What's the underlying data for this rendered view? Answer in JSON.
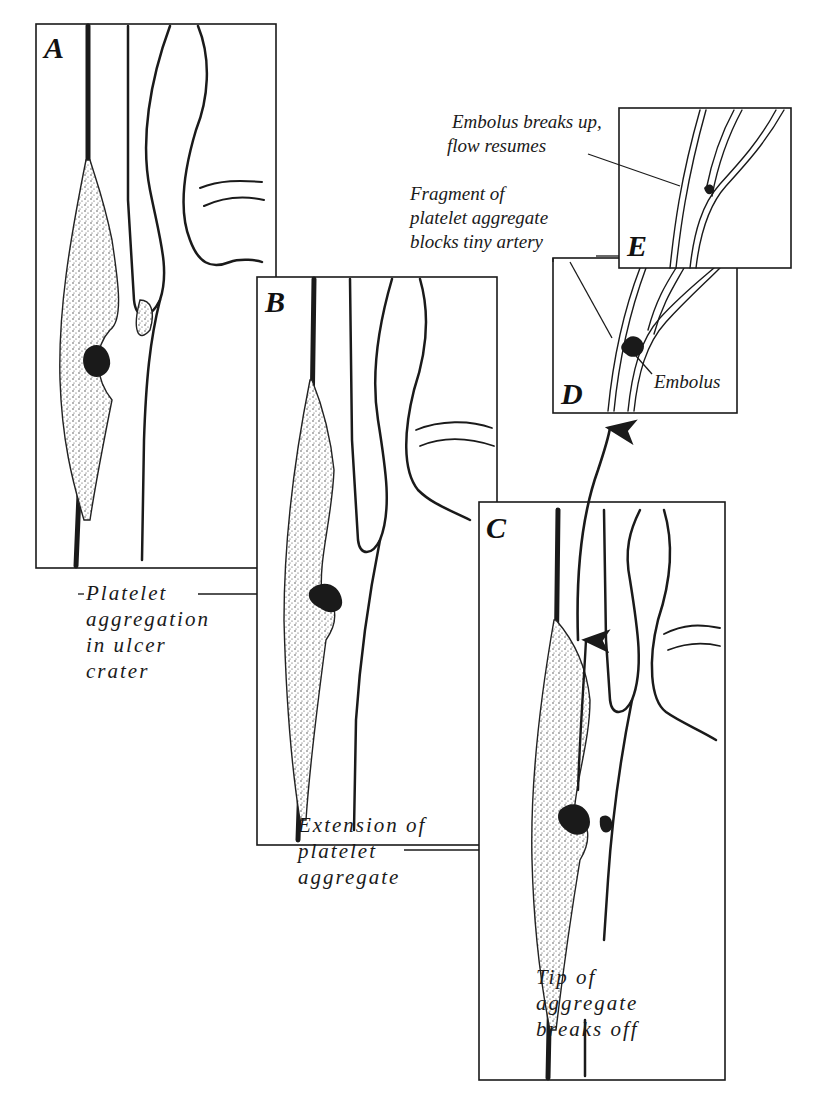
{
  "figure": {
    "panels": [
      {
        "id": "A",
        "letter": "A",
        "caption_lines": [
          "Platelet",
          "aggregation",
          "in ulcer",
          "crater"
        ]
      },
      {
        "id": "B",
        "letter": "B",
        "caption_lines": [
          "Extension of",
          "platelet",
          "aggregate"
        ]
      },
      {
        "id": "C",
        "letter": "C",
        "caption_lines": [
          "Tip of",
          "aggregate",
          "breaks off"
        ]
      },
      {
        "id": "D",
        "letter": "D",
        "caption_lines": [
          "Fragment of",
          "platelet aggregate",
          "blocks tiny artery"
        ],
        "callout": "Embolus"
      },
      {
        "id": "E",
        "letter": "E",
        "caption_lines": [
          "Embolus breaks up,",
          "flow resumes"
        ]
      }
    ],
    "colors": {
      "ink": "#1a1a1a",
      "background": "#ffffff"
    }
  }
}
